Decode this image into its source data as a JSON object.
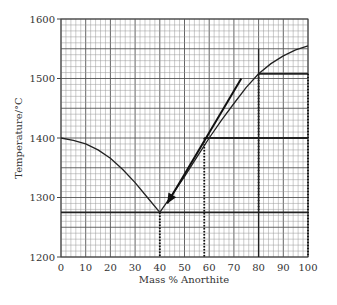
{
  "chart_data": {
    "type": "line",
    "title": "",
    "xlabel": "Mass % Anorthite",
    "ylabel": "Temperature/°C",
    "xlim": [
      0,
      100
    ],
    "ylim": [
      1200,
      1600
    ],
    "grid": true,
    "x_ticks": [
      0,
      10,
      20,
      30,
      40,
      50,
      60,
      70,
      80,
      90,
      100
    ],
    "y_ticks": [
      1200,
      1300,
      1400,
      1500,
      1600
    ],
    "series": [
      {
        "name": "liquidus-left",
        "x": [
          0,
          5,
          10,
          15,
          20,
          25,
          30,
          35,
          40
        ],
        "values": [
          1400,
          1396,
          1390,
          1380,
          1366,
          1347,
          1325,
          1300,
          1275
        ]
      },
      {
        "name": "liquidus-right",
        "x": [
          40,
          45,
          50,
          55,
          60,
          65,
          70,
          75,
          80,
          85,
          90,
          95,
          100
        ],
        "values": [
          1275,
          1305,
          1335,
          1368,
          1400,
          1430,
          1458,
          1485,
          1508,
          1525,
          1538,
          1548,
          1555
        ]
      }
    ],
    "annotations": {
      "eutectic_line": {
        "y": 1275,
        "x_from": 0,
        "x_to": 100
      },
      "horizontal_lines": [
        {
          "y": 1400,
          "x_from": 58,
          "x_to": 100
        },
        {
          "y": 1508,
          "x_from": 80,
          "x_to": 100
        }
      ],
      "dotted_verticals": [
        {
          "x": 40,
          "y_from": 1275,
          "y_to": 1200
        },
        {
          "x": 58,
          "y_from": 1400,
          "y_to": 1200
        },
        {
          "x": 80,
          "y_from": 1508,
          "y_to": 1275
        },
        {
          "x": 100,
          "y_from": 1508,
          "y_to": 1200
        }
      ],
      "solid_vertical": {
        "x": 80,
        "y_from": 1550,
        "y_to": 1200
      },
      "arrow": {
        "from": [
          73,
          1500
        ],
        "to": [
          43,
          1290
        ]
      }
    }
  }
}
